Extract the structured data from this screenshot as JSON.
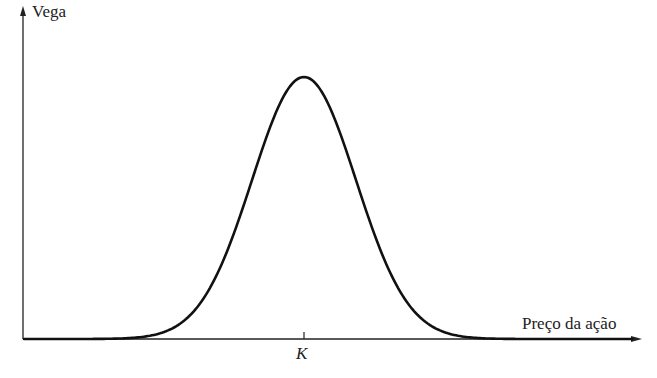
{
  "chart_data": {
    "type": "line",
    "title": "",
    "xlabel": "Preço da ação",
    "ylabel": "Vega",
    "x_ticks": [
      {
        "position": "K",
        "label": "K"
      }
    ],
    "y_ticks": [],
    "grid": false,
    "legend": null,
    "series": [
      {
        "name": "Vega",
        "description": "Bell-shaped curve peaking at strike price K, approaching zero far from K",
        "x": [
          0.0,
          0.2,
          0.3,
          0.35,
          0.4,
          0.45,
          0.5,
          0.55,
          0.6,
          0.65,
          0.7,
          0.8,
          1.0
        ],
        "x_relative_to_K": [
          "far below K",
          "",
          "",
          "",
          "",
          "",
          "K",
          "",
          "",
          "",
          "",
          "",
          "far above K"
        ],
        "values": [
          0.0,
          0.0,
          0.04,
          0.18,
          0.5,
          0.86,
          1.0,
          0.86,
          0.5,
          0.18,
          0.04,
          0.0,
          0.0
        ]
      }
    ],
    "peak": {
      "x": "K",
      "y": "max"
    },
    "color": "#111111"
  },
  "axes": {
    "y_label": "Vega",
    "x_label": "Preço da ação",
    "k_label": "K"
  }
}
